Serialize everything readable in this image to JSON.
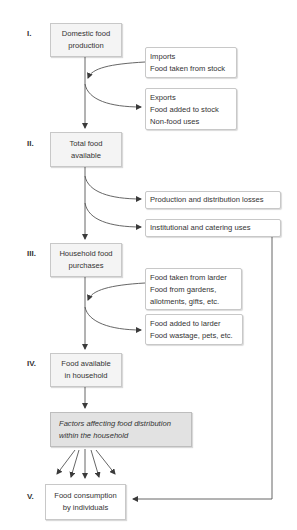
{
  "diagram": {
    "stages": [
      {
        "numeral": "I.",
        "label_lines": [
          "Domestic food",
          "production"
        ]
      },
      {
        "numeral": "II.",
        "label_lines": [
          "Total food",
          "available"
        ]
      },
      {
        "numeral": "III.",
        "label_lines": [
          "Household food",
          "purchases"
        ]
      },
      {
        "numeral": "IV.",
        "label_lines": [
          "Food available",
          "in household"
        ]
      },
      {
        "numeral": "V.",
        "label_lines": [
          "Food consumption",
          "by individuals"
        ]
      }
    ],
    "factors_box": {
      "label_lines": [
        "Factors affecting food distribution",
        "within the household"
      ]
    },
    "side_boxes": {
      "inflow_national": {
        "lines": [
          "Imports",
          "Food taken from stock"
        ],
        "direction": "in"
      },
      "outflow_national": {
        "lines": [
          "Exports",
          "Food added to stock",
          "Non-food uses"
        ],
        "direction": "out"
      },
      "production_losses": {
        "lines": [
          "Production and distribution losses"
        ],
        "direction": "out"
      },
      "institutional": {
        "lines": [
          "Institutional and catering uses"
        ],
        "direction": "out",
        "feeds_into": "V."
      },
      "inflow_household": {
        "lines": [
          "Food taken from larder",
          "Food from gardens,",
          "allotments, gifts, etc."
        ],
        "direction": "in"
      },
      "outflow_household": {
        "lines": [
          "Food added to larder",
          "Food wastage, pets, etc."
        ],
        "direction": "out"
      }
    },
    "colors": {
      "box_border": "#c8c8c8",
      "main_box_fill": "#f4f4f4",
      "factors_fill": "#e2e2e2",
      "line": "#4a4a4a",
      "text": "#333333"
    }
  }
}
